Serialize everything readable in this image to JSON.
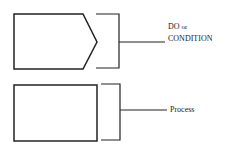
{
  "diagram": {
    "symbols": [
      {
        "shape": "pentagon-arrow",
        "label_line1": "DO",
        "label_line1_suffix": "or",
        "label_line2": "CONDITION"
      },
      {
        "shape": "rectangle",
        "label": "Process"
      }
    ],
    "colors": {
      "stroke": "#222222",
      "background": "#ffffff"
    }
  }
}
